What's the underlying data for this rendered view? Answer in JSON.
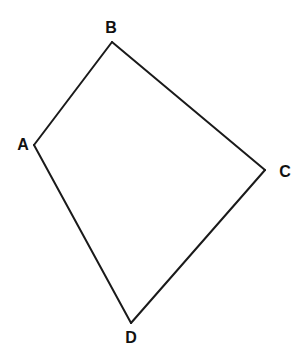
{
  "diagram": {
    "type": "quadrilateral",
    "stroke_color": "#1a1a1a",
    "label_color": "#111111",
    "vertices": [
      {
        "id": "A",
        "label": "A",
        "x": 34,
        "y": 145,
        "label_x": 23,
        "label_y": 144
      },
      {
        "id": "B",
        "label": "B",
        "x": 112,
        "y": 42,
        "label_x": 111,
        "label_y": 27
      },
      {
        "id": "C",
        "label": "C",
        "x": 265,
        "y": 170,
        "label_x": 285,
        "label_y": 171
      },
      {
        "id": "D",
        "label": "D",
        "x": 131,
        "y": 323,
        "label_x": 131,
        "label_y": 337
      }
    ],
    "edges": [
      {
        "from": "A",
        "to": "B"
      },
      {
        "from": "B",
        "to": "C"
      },
      {
        "from": "C",
        "to": "D"
      },
      {
        "from": "D",
        "to": "A"
      }
    ]
  }
}
